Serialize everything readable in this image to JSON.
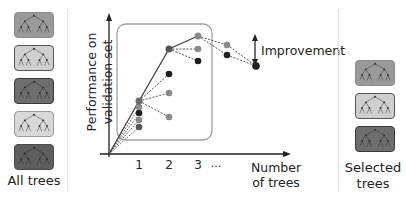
{
  "left_panel": {
    "label": "All trees",
    "trees": [
      {
        "fill": "#9a9a9a",
        "border": "#8a8a8a"
      },
      {
        "fill": "#cfcfcf",
        "border": "#555555"
      },
      {
        "fill": "#6e6e6e",
        "border": "#3a3a3a"
      },
      {
        "fill": "#d8d8d8",
        "border": "#9a9a9a"
      },
      {
        "fill": "#5e5e5e",
        "border": "#4a4a4a"
      }
    ]
  },
  "chart": {
    "ylabel_line1": "Performance on",
    "ylabel_line2": "validation set",
    "xlabel_line1": "Number",
    "xlabel_line2": "of trees",
    "xticks": [
      "1",
      "2",
      "3",
      "..."
    ],
    "annotation": "Improvement",
    "colors": {
      "axis": "#222222",
      "selection_box": "#a0a0a0",
      "dark_point": "#2a2a2a",
      "mid_point": "#6a6a6a",
      "light_point": "#9a9a9a"
    }
  },
  "right_panel": {
    "label_line1": "Selected",
    "label_line2": "trees",
    "trees": [
      {
        "fill": "#9a9a9a",
        "border": "#8a8a8a"
      },
      {
        "fill": "#cfcfcf",
        "border": "#555555"
      },
      {
        "fill": "#6e6e6e",
        "border": "#3a3a3a"
      }
    ]
  }
}
